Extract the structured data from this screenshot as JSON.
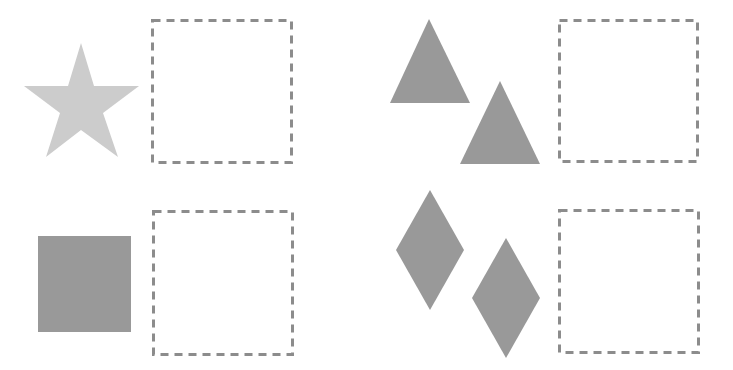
{
  "colors": {
    "background": "#ffffff",
    "star": "#cccccc",
    "shape_dark": "#999999",
    "dashed_border": "#8c8c8c"
  },
  "puzzle": {
    "panels": [
      {
        "name": "star-panel",
        "shape": "star",
        "count": 1,
        "answer_box": "empty"
      },
      {
        "name": "triangle-panel",
        "shape": "triangle",
        "count": 2,
        "answer_box": "empty"
      },
      {
        "name": "square-panel",
        "shape": "square",
        "count": 1,
        "answer_box": "empty"
      },
      {
        "name": "diamond-panel",
        "shape": "diamond",
        "count": 2,
        "answer_box": "empty"
      }
    ]
  }
}
